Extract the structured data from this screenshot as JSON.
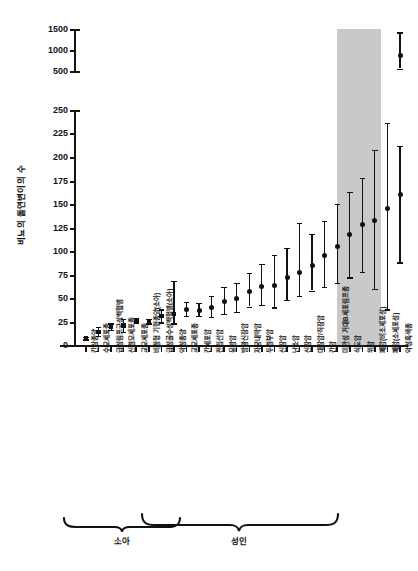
{
  "chart_data": {
    "type": "scatter",
    "title": "",
    "xlabel": "",
    "ylabel": "비뇨의 돌연변이의 수",
    "ylim": [
      0,
      250
    ],
    "ylim_upper": [
      500,
      1500
    ],
    "grid": false,
    "legend": null,
    "broken_axis": true,
    "yticks_upper": [
      "1500",
      "1000",
      "500"
    ],
    "yticks_lower": [
      "250",
      "225",
      "200",
      "175",
      "150",
      "125",
      "100",
      "75",
      "50",
      "25",
      "0"
    ],
    "categories": [
      "간상종양",
      "수모세포종",
      "급성림프구성백혈병",
      "신경모세포종",
      "교모세포종",
      "비정형 기형종양(소아)",
      "급성골수성백혈병(소아)",
      "악성종양",
      "교모세포종",
      "간세포암",
      "전립선암",
      "유방암",
      "방광신장암",
      "자궁내막암",
      "두경부암",
      "신장암",
      "난소암",
      "신장암",
      "대장암/직장암",
      "간암",
      "미만성 거대B세포림프종",
      "식도암",
      "위암",
      "폐암(비소세포성)",
      "폐암(소세포성)",
      "악성흑색종"
    ],
    "values": [
      7,
      14,
      19,
      21,
      26,
      25,
      31,
      33,
      38,
      37,
      40,
      46,
      49,
      57,
      62,
      63,
      72,
      77,
      85,
      95,
      105,
      118,
      128,
      133,
      145,
      160
    ],
    "errors_low": [
      6,
      10,
      16,
      14,
      24,
      23,
      24,
      23,
      31,
      31,
      30,
      33,
      35,
      41,
      43,
      40,
      48,
      52,
      58,
      62,
      66,
      72,
      78,
      60,
      38,
      88
    ],
    "errors_high": [
      9,
      19,
      23,
      28,
      28,
      28,
      38,
      68,
      46,
      45,
      52,
      62,
      66,
      77,
      86,
      96,
      103,
      130,
      118,
      132,
      150,
      163,
      178,
      208,
      236,
      212
    ],
    "upper_point": {
      "category": "악성흑색종",
      "value": 880,
      "low": 560,
      "high": 1420
    },
    "annotations": {
      "pediatric_bracket": "소아",
      "adult_bracket": "성인"
    },
    "highlight": {
      "color": "#c9c9c9",
      "covers": [
        "폐암(비소세포성)",
        "폐암(소세포성)"
      ]
    }
  },
  "axis": {
    "label_y": "비뇨의 돌연변이의 수"
  }
}
